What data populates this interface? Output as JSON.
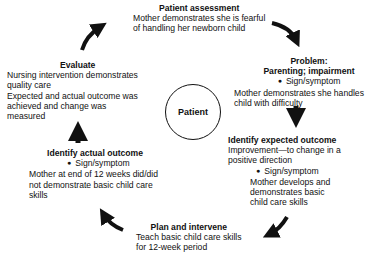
{
  "center": {
    "label": "Patient"
  },
  "steps": {
    "assessment": {
      "title": "Patient assessment",
      "lines": [
        "Mother demonstrates she is fearful",
        "of handling her newborn child"
      ]
    },
    "problem": {
      "title_lines": [
        "Problem:",
        "Parenting; impairment"
      ],
      "bullet": "Sign/symptom",
      "lines": [
        "Mother demonstrates she handles",
        "child with difficulty"
      ]
    },
    "expected_outcome": {
      "title": "Identify expected outcome",
      "lines": [
        "Improvement—to change in a",
        "positive direction"
      ],
      "bullet": "Sign/symptom",
      "detail_lines": [
        "Mother develops and",
        "demonstrates basic",
        "child care skills"
      ]
    },
    "plan": {
      "title": "Plan and intervene",
      "lines": [
        "Teach basic child care skills",
        "for 12-week period"
      ]
    },
    "actual_outcome": {
      "title": "Identify actual outcome",
      "bullet": "Sign/symptom",
      "lines": [
        "Mother at end of 12 weeks did/did",
        "not demonstrate basic child care",
        "skills"
      ]
    },
    "evaluate": {
      "title": "Evaluate",
      "lines": [
        "Nursing intervention demonstrates",
        "quality care",
        "Expected and actual outcome was",
        "achieved and change was",
        "measured"
      ]
    }
  },
  "arrows": [
    {
      "name": "evaluate-to-assessment",
      "direction": "up-right"
    },
    {
      "name": "assessment-to-problem",
      "direction": "down-right"
    },
    {
      "name": "problem-to-expected",
      "direction": "down"
    },
    {
      "name": "expected-to-plan",
      "direction": "down-left"
    },
    {
      "name": "plan-to-actual",
      "direction": "up-left"
    },
    {
      "name": "actual-to-evaluate",
      "direction": "up"
    }
  ]
}
